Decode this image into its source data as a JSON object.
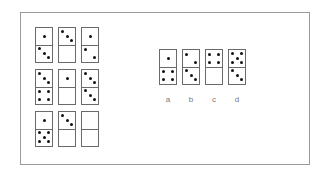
{
  "puzzle": {
    "grid": [
      {
        "top": 1,
        "bottom": 3,
        "top_pattern": "center",
        "bottom_pattern": "diag3"
      },
      {
        "top": 3,
        "bottom": 0,
        "top_pattern": "diag3",
        "bottom_pattern": "blank"
      },
      {
        "top": 1,
        "bottom": 2,
        "top_pattern": "center",
        "bottom_pattern": "diag2"
      },
      {
        "top": 3,
        "bottom": 4,
        "top_pattern": "diag3",
        "bottom_pattern": "four"
      },
      {
        "top": 1,
        "bottom": 0,
        "top_pattern": "center",
        "bottom_pattern": "blank"
      },
      {
        "top": 3,
        "bottom": 3,
        "top_pattern": "diag3",
        "bottom_pattern": "diag3"
      },
      {
        "top": 1,
        "bottom": 5,
        "top_pattern": "center",
        "bottom_pattern": "five"
      },
      {
        "top": 3,
        "bottom": 0,
        "top_pattern": "diag3",
        "bottom_pattern": "blank"
      },
      {
        "top": null,
        "bottom": null,
        "top_pattern": "blank",
        "bottom_pattern": "blank"
      }
    ],
    "options": [
      {
        "label": "a",
        "top": 1,
        "bottom": 4,
        "top_pattern": "center",
        "bottom_pattern": "four"
      },
      {
        "label": "b",
        "top": 2,
        "bottom": 3,
        "top_pattern": "diag2",
        "bottom_pattern": "diag3"
      },
      {
        "label": "c",
        "top": 4,
        "bottom": 0,
        "top_pattern": "four",
        "bottom_pattern": "blank"
      },
      {
        "label": "d",
        "top": 5,
        "bottom": 3,
        "top_pattern": "five",
        "bottom_pattern": "diag3"
      }
    ]
  }
}
